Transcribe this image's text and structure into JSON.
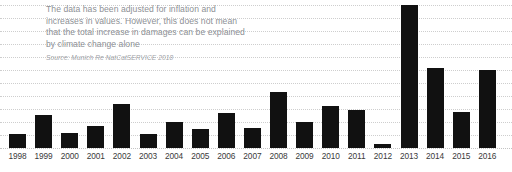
{
  "annotation": {
    "lines": [
      "The data has been adjusted for inflation and",
      "increases in values. However, this does not mean",
      "that the total increase in damages can be explained",
      "by climate change alone"
    ],
    "source": "Source: Munich Re NatCatSERVICE 2018"
  },
  "colors": {
    "bar": "#111111",
    "gridline": "#c9c9c9",
    "annotation_text": "#8d9095",
    "source_text": "#a0a3a8",
    "axis_label": "#3a3a3a",
    "background": "#ffffff"
  },
  "chart_data": {
    "type": "bar",
    "title": "",
    "subtitle": "",
    "xlabel": "",
    "ylabel": "",
    "grid": true,
    "legend": "none",
    "gridline_count": 12,
    "categories": [
      "1998",
      "1999",
      "2000",
      "2001",
      "2002",
      "2003",
      "2004",
      "2005",
      "2006",
      "2007",
      "2008",
      "2009",
      "2010",
      "2011",
      "2012",
      "2013",
      "2014",
      "2015",
      "2016"
    ],
    "values": [
      14,
      33,
      15,
      22,
      44,
      14,
      26,
      19,
      35,
      20,
      56,
      26,
      42,
      38,
      4,
      143,
      80,
      36,
      78
    ],
    "ylim": [
      0,
      156
    ],
    "units": "relative bar height (px above baseline)"
  }
}
